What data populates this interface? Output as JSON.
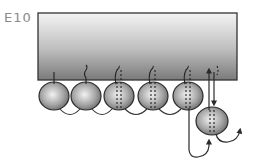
{
  "figure": {
    "panel_label": "E10",
    "block": {
      "x": 38,
      "y": 13,
      "width": 199,
      "height": 67,
      "gradient_top": "#f2f2f2",
      "gradient_bottom": "#7a7a7a"
    },
    "cells": [
      {
        "cx": 54,
        "cy": 96,
        "junction": "solid"
      },
      {
        "cx": 86,
        "cy": 96,
        "junction": "wavy"
      },
      {
        "cx": 119,
        "cy": 96,
        "junction": "dashed"
      },
      {
        "cx": 153,
        "cy": 96,
        "junction": "dashed"
      },
      {
        "cx": 188,
        "cy": 96,
        "junction": "dashed"
      }
    ],
    "detached_cell": {
      "cx": 212,
      "cy": 121,
      "junction": "dashed"
    },
    "colors": {
      "outline": "#2a2a2a",
      "cell_light": "#e8e8e8",
      "cell_dark": "#6e6e6e"
    }
  }
}
